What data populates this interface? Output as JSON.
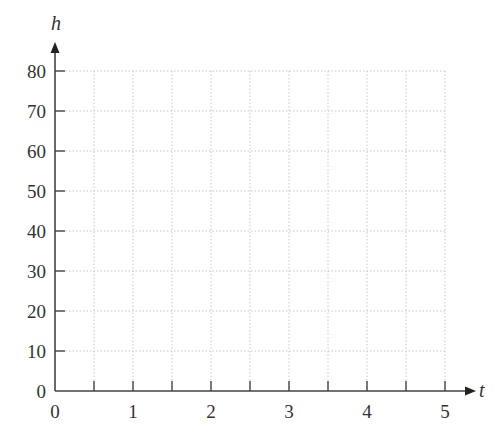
{
  "chart_data": {
    "type": "line",
    "title": "",
    "xlabel": "t",
    "ylabel": "h",
    "xlim": [
      0,
      5
    ],
    "ylim": [
      0,
      80
    ],
    "x_ticks": [
      0,
      1,
      2,
      3,
      4,
      5
    ],
    "x_minor_ticks": [
      0.5,
      1.5,
      2.5,
      3.5,
      4.5
    ],
    "y_ticks": [
      0,
      10,
      20,
      30,
      40,
      50,
      60,
      70,
      80
    ],
    "grid": true,
    "grid_style": "dotted",
    "series": [],
    "legend": null
  },
  "colors": {
    "axis": "#444444",
    "grid": "#c8c8c8",
    "text": "#333333"
  }
}
